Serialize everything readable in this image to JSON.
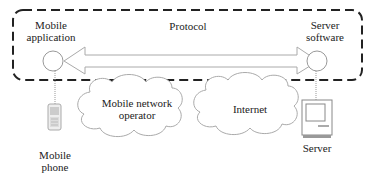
{
  "diagram": {
    "type": "mobile-client-server-architecture",
    "protocol_label": "Protocol",
    "nodes": {
      "mobile_application": {
        "line1": "Mobile",
        "line2": "application"
      },
      "server_software": {
        "line1": "Server",
        "line2": "software"
      },
      "mobile_phone": {
        "line1": "Mobile",
        "line2": "phone"
      },
      "server": {
        "label": "Server"
      }
    },
    "clouds": {
      "mobile_network_operator": {
        "line1": "Mobile network",
        "line2": "operator"
      },
      "internet": {
        "label": "Internet"
      }
    },
    "colors": {
      "dashed_border": "#222222",
      "thin_lines": "#9a9a9a",
      "text": "#222222"
    }
  }
}
